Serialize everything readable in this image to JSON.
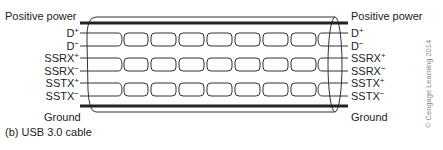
{
  "diagram": {
    "caption": "(b) USB 3.0 cable",
    "left_labels": {
      "top": "Positive power",
      "bottom": "Ground",
      "wires": [
        {
          "base": "D",
          "sign": "+"
        },
        {
          "base": "D",
          "sign": "−"
        },
        {
          "base": "SSRX",
          "sign": "+"
        },
        {
          "base": "SSRX",
          "sign": "−"
        },
        {
          "base": "SSTX",
          "sign": "+"
        },
        {
          "base": "SSTX",
          "sign": "−"
        }
      ]
    },
    "right_labels": {
      "top": "Positive power",
      "bottom": "Ground",
      "wires": [
        {
          "base": "D",
          "sign": "+"
        },
        {
          "base": "D",
          "sign": "−"
        },
        {
          "base": "SSRX",
          "sign": "+"
        },
        {
          "base": "SSRX",
          "sign": "−"
        },
        {
          "base": "SSTX",
          "sign": "+"
        },
        {
          "base": "SSTX",
          "sign": "−"
        }
      ]
    },
    "copyright": "© Cengage Learning 2014"
  }
}
